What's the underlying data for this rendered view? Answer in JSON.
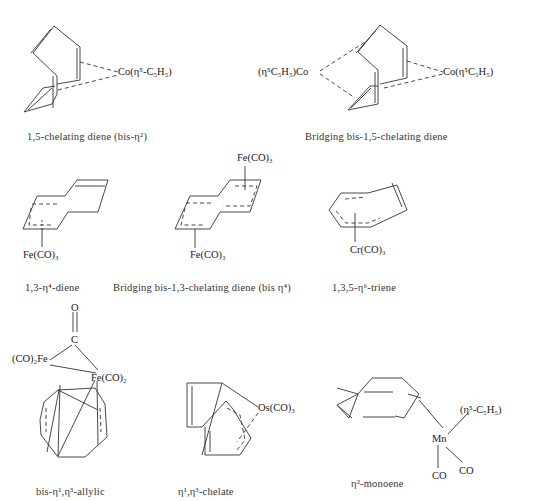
{
  "structures": [
    {
      "id": "s1",
      "caption": "1,5-chelating diene (bis-η²)",
      "metal_labels": [
        "Co(η⁵-C₅H₅)"
      ]
    },
    {
      "id": "s2",
      "caption": "Bridging bis-1,5-chelating diene",
      "metal_labels": [
        "(η⁵C₅H₅)Co",
        "Co(η⁵C₅H₅)"
      ]
    },
    {
      "id": "s3",
      "caption": "1,3-η⁴-diene",
      "metal_labels": [
        "Fe(CO)₃"
      ]
    },
    {
      "id": "s4",
      "caption": "Bridging bis-1,3-chelating diene (bis η⁴)",
      "metal_labels": [
        "Fe(CO)₃",
        "Fe(CO)₃"
      ]
    },
    {
      "id": "s5",
      "caption": "1,3,5-η⁶-triene",
      "metal_labels": [
        "Cr(CO)₃"
      ]
    },
    {
      "id": "s6",
      "caption": "bis-η¹,η³-allylic",
      "metal_labels": [
        "O",
        "C",
        "(CO)₂Fe",
        "Fe(CO)₂"
      ]
    },
    {
      "id": "s7",
      "caption": "η¹,η³-chelate",
      "metal_labels": [
        "Os(CO)₃"
      ]
    },
    {
      "id": "s8",
      "caption": "η²-monoene",
      "metal_labels": [
        "Mn",
        "(η⁵-C₅H₅)",
        "CO",
        "CO"
      ]
    }
  ]
}
